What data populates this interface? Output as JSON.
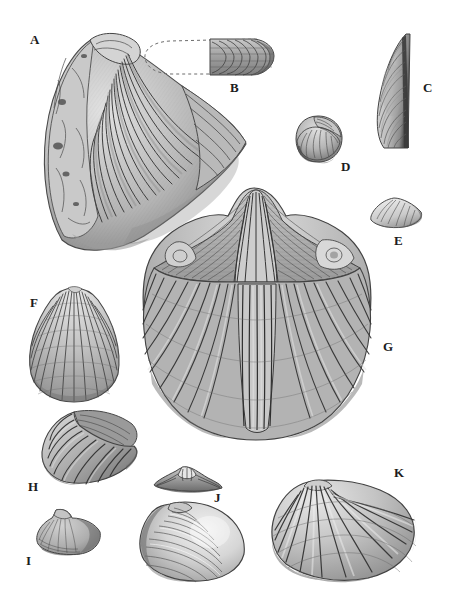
{
  "plate": {
    "type": "scientific-illustration-plate",
    "subject": "fossil bivalve and brachiopod shells",
    "background_color": "#ffffff",
    "ink_color": "#3a3a3a",
    "width": 452,
    "height": 606,
    "specimen_count": 11
  },
  "labels": [
    {
      "id": "A",
      "text": "A",
      "x": 30,
      "y": 33,
      "specimen": "large-ribbed-shell-oblique"
    },
    {
      "id": "B",
      "text": "B",
      "x": 230,
      "y": 81,
      "specimen": "elongate-shell-with-dashed-reconstruction"
    },
    {
      "id": "C",
      "text": "C",
      "x": 423,
      "y": 81,
      "specimen": "tall-wedge-shell"
    },
    {
      "id": "D",
      "text": "D",
      "x": 341,
      "y": 160,
      "specimen": "small-gastropod-coiled-shell"
    },
    {
      "id": "E",
      "text": "E",
      "x": 394,
      "y": 234,
      "specimen": "small-triangular-clam"
    },
    {
      "id": "F",
      "text": "F",
      "x": 30,
      "y": 296,
      "specimen": "radially-ribbed-fan-shell"
    },
    {
      "id": "G",
      "text": "G",
      "x": 383,
      "y": 340,
      "specimen": "large-spiriferid-brachiopod"
    },
    {
      "id": "H",
      "text": "H",
      "x": 28,
      "y": 480,
      "specimen": "concentrically-ribbed-oblique-shell"
    },
    {
      "id": "I",
      "text": "I",
      "x": 26,
      "y": 554,
      "specimen": "small-worn-shell"
    },
    {
      "id": "J",
      "text": "J",
      "x": 214,
      "y": 491,
      "specimen": "smooth-oval-clam-with-hinge-view"
    },
    {
      "id": "K",
      "text": "K",
      "x": 394,
      "y": 466,
      "specimen": "broad-radially-ribbed-shell"
    }
  ],
  "specimens": [
    {
      "id": "A",
      "name": "large-ribbed-shell-oblique",
      "bbox": [
        38,
        32,
        252,
        224
      ],
      "description": "Large oblique shell, coarse radiating ribs fanning right, eroded umbonal margin left"
    },
    {
      "id": "B",
      "name": "elongate-shell-with-dashed-reconstruction",
      "bbox": [
        146,
        38,
        126,
        45
      ],
      "description": "Elongate shell; dashed outline reconstruction at left, preserved concentrically ornamented fragment at right"
    },
    {
      "id": "C",
      "name": "tall-wedge-shell",
      "bbox": [
        374,
        32,
        44,
        118
      ],
      "description": "Tall narrow wedge-shaped shell, concentric growth lines, dark straight posterior margin"
    },
    {
      "id": "D",
      "name": "small-gastropod-coiled-shell",
      "bbox": [
        292,
        115,
        52,
        50
      ],
      "description": "Small coiled gastropod shell, low spire"
    },
    {
      "id": "E",
      "name": "small-triangular-clam",
      "bbox": [
        368,
        196,
        56,
        34
      ],
      "description": "Small triangular clam, light shading, concentric lines"
    },
    {
      "id": "F",
      "name": "radially-ribbed-fan-shell",
      "bbox": [
        26,
        288,
        98,
        112
      ],
      "description": "Fan-shaped shell with many fine radial ribs and beaded intersections"
    },
    {
      "id": "G",
      "name": "large-spiriferid-brachiopod",
      "bbox": [
        140,
        182,
        232,
        256
      ],
      "description": "Largest specimen: spiriferid brachiopod with triangular interarea, median fold and strong radiating plications"
    },
    {
      "id": "H",
      "name": "concentrically-ribbed-oblique-shell",
      "bbox": [
        38,
        408,
        110,
        74
      ],
      "description": "Oblique shell with strong concentric rugae and flattened posterior wing"
    },
    {
      "id": "I",
      "name": "small-worn-shell",
      "bbox": [
        32,
        508,
        72,
        48
      ],
      "description": "Small worn shell with faint ornament"
    },
    {
      "id": "J",
      "name": "smooth-oval-clam-with-hinge-view",
      "bbox": [
        138,
        466,
        110,
        112
      ],
      "description": "Smooth oval clam with fine concentric lines, plus separate dorsal hinge view above"
    },
    {
      "id": "K",
      "name": "broad-radially-ribbed-shell",
      "bbox": [
        268,
        478,
        148,
        104
      ],
      "description": "Broad shell with coarse radiating ribs diverging from upper-left beak"
    }
  ]
}
